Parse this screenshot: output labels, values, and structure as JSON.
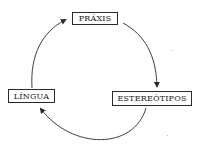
{
  "diagram": {
    "type": "cycle",
    "nodes": [
      {
        "id": "praxis",
        "label": "PRÁXIS"
      },
      {
        "id": "estereotipos",
        "label": "ESTEREÓTIPOS"
      },
      {
        "id": "lingua",
        "label": "LÍNGUA"
      }
    ],
    "edges": [
      {
        "from": "praxis",
        "to": "estereotipos",
        "direction": "clockwise"
      },
      {
        "from": "estereotipos",
        "to": "lingua",
        "direction": "clockwise"
      },
      {
        "from": "lingua",
        "to": "praxis",
        "direction": "clockwise"
      }
    ],
    "colors": {
      "stroke": "#2a2a2a",
      "background": "#ffffff",
      "text": "#1a1a1a"
    }
  }
}
